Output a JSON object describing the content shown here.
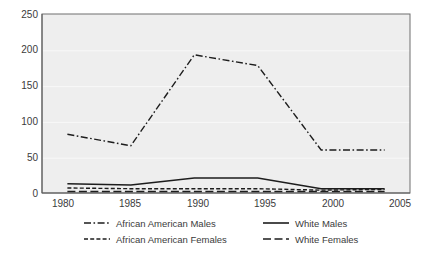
{
  "chart_data": {
    "type": "line",
    "title": "",
    "subtitle": "",
    "xlabel": "",
    "ylabel": "",
    "x": [
      1980,
      1985,
      1990,
      1995,
      2000,
      2005
    ],
    "xticklabels": [
      "1980",
      "1985",
      "1990",
      "1995",
      "2000",
      "2005"
    ],
    "yticks": [
      0,
      50,
      100,
      150,
      200,
      250
    ],
    "yticklabels": [
      "0",
      "50",
      "100",
      "150",
      "200",
      "250"
    ],
    "xlim": [
      1978,
      2007
    ],
    "ylim": [
      0,
      250
    ],
    "grid": true,
    "legend_position": "bottom",
    "plot_background": "#eeeeee",
    "line_color": "#1d1d1d",
    "series": [
      {
        "name": "African American Males",
        "style": "dash-dot",
        "dasharray": "7,2.5,1.6,2.5",
        "width": 1.4,
        "values": [
          82,
          66,
          193,
          178,
          60,
          60
        ]
      },
      {
        "name": "African American Females",
        "style": "dashed-short",
        "dasharray": "4,2.2",
        "width": 1.4,
        "values": [
          7,
          6,
          6,
          6,
          4,
          5
        ]
      },
      {
        "name": "White Males",
        "style": "solid",
        "dasharray": "none",
        "width": 1.5,
        "values": [
          13,
          11,
          21,
          21,
          6,
          6
        ]
      },
      {
        "name": "White Females",
        "style": "dashed-long",
        "dasharray": "8,3.5",
        "width": 1.4,
        "values": [
          2,
          2,
          2,
          2,
          2,
          2
        ]
      }
    ]
  },
  "legend": {
    "entries": [
      {
        "label": "African American Males",
        "swatch": "dash-dot"
      },
      {
        "label": "White Males",
        "swatch": "solid"
      },
      {
        "label": "African American Females",
        "swatch": "dashed-short"
      },
      {
        "label": "White Females",
        "swatch": "dashed-long"
      }
    ]
  }
}
